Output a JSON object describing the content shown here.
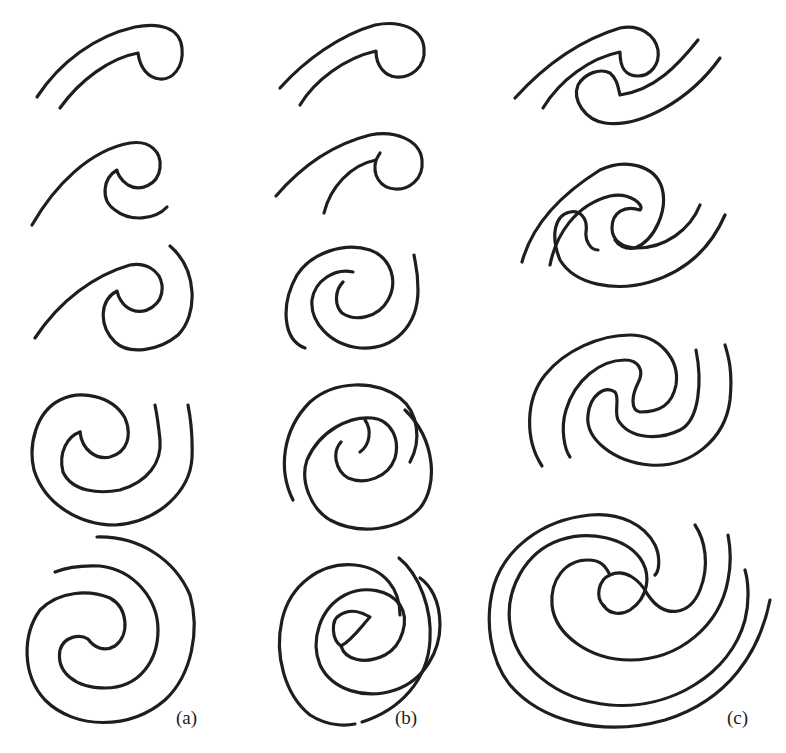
{
  "figure": {
    "columns": [
      {
        "id": "a",
        "label": "(a)",
        "stages": 5
      },
      {
        "id": "b",
        "label": "(b)",
        "stages": 5
      },
      {
        "id": "c",
        "label": "(c)",
        "stages": 4
      }
    ],
    "stroke_color": "#1e1e1e",
    "background": "#ffffff"
  }
}
